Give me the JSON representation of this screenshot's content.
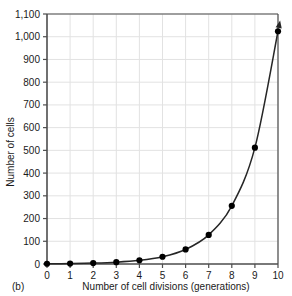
{
  "panel": {
    "label": "(b)"
  },
  "chart_data": {
    "type": "line",
    "title": "",
    "xlabel": "Number of cell divisions (generations)",
    "ylabel": "Number of cells",
    "x": [
      0,
      1,
      2,
      3,
      4,
      5,
      6,
      7,
      8,
      9,
      10
    ],
    "values": [
      1,
      2,
      4,
      8,
      16,
      32,
      64,
      128,
      256,
      512,
      1024
    ],
    "series": [
      {
        "name": "Number of cells",
        "values": [
          1,
          2,
          4,
          8,
          16,
          32,
          64,
          128,
          256,
          512,
          1024
        ]
      }
    ],
    "xlim": [
      0,
      10
    ],
    "ylim": [
      0,
      1100
    ],
    "xticks": [
      0,
      1,
      2,
      3,
      4,
      5,
      6,
      7,
      8,
      9,
      10
    ],
    "xtick_labels": [
      "0",
      "1",
      "2",
      "3",
      "4",
      "5",
      "6",
      "7",
      "8",
      "9",
      "10"
    ],
    "yticks": [
      0,
      100,
      200,
      300,
      400,
      500,
      600,
      700,
      800,
      900,
      1000,
      1100
    ],
    "ytick_labels": [
      "0",
      "100",
      "200",
      "300",
      "400",
      "500",
      "600",
      "700",
      "800",
      "900",
      "1,000",
      "1,100"
    ],
    "grid": true,
    "legend": "none",
    "marker": "filled-circle",
    "line_color": "#262626",
    "marker_color": "#000000",
    "grid_color": "#e2e2e2",
    "axis_color": "#4d4d4d",
    "annotation": "arrowhead at end of curve"
  }
}
